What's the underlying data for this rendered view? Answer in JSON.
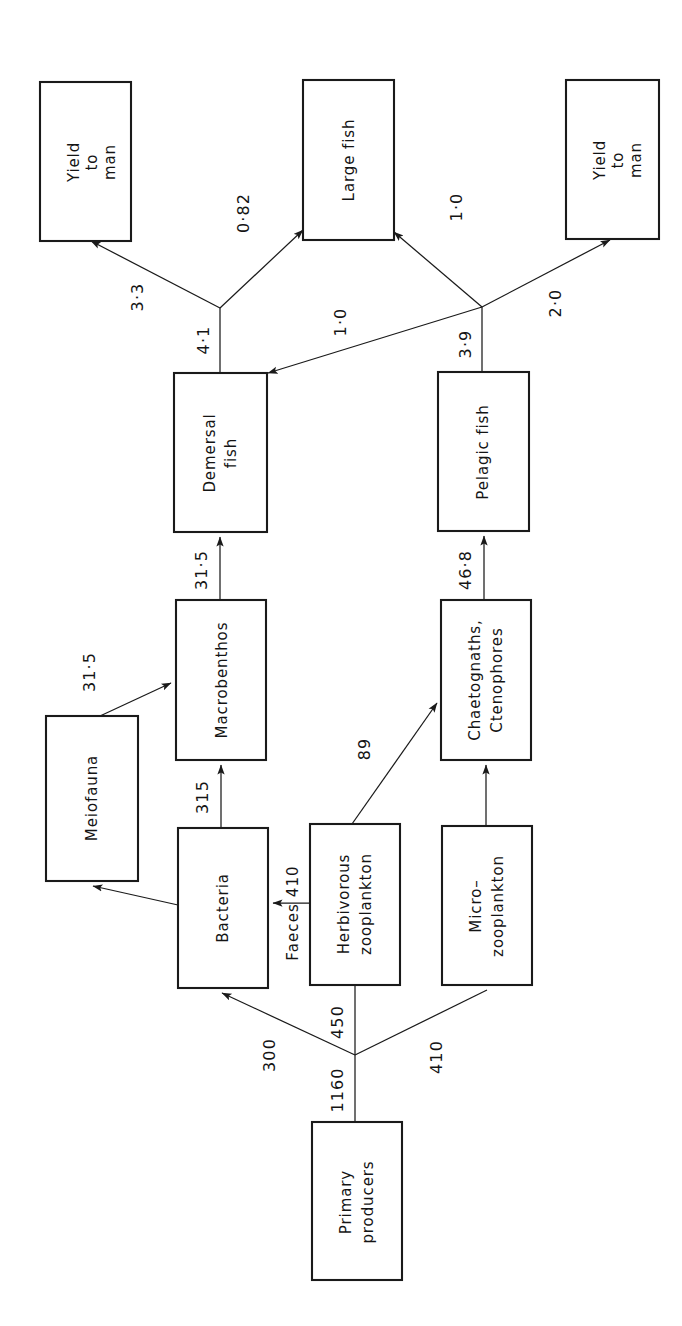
{
  "diagram": {
    "orientation": "rotated-90-ccw",
    "stroke_color": "#1a1a1a",
    "background_color": "#ffffff",
    "nodes": [
      {
        "id": "yield_left",
        "label_lines": [
          "Yield",
          "to",
          "man"
        ]
      },
      {
        "id": "large_fish",
        "label_lines": [
          "Large fish"
        ]
      },
      {
        "id": "yield_right",
        "label_lines": [
          "Yield",
          "to",
          "man"
        ]
      },
      {
        "id": "demersal_fish",
        "label_lines": [
          "Demersal",
          "fish"
        ]
      },
      {
        "id": "pelagic_fish",
        "label_lines": [
          "Pelagic fish"
        ]
      },
      {
        "id": "meiofauna",
        "label_lines": [
          "Meiofauna"
        ]
      },
      {
        "id": "macrobenthos",
        "label_lines": [
          "Macrobenthos"
        ]
      },
      {
        "id": "chaetognaths",
        "label_lines": [
          "Chaetognaths,",
          "Ctenophores"
        ]
      },
      {
        "id": "bacteria",
        "label_lines": [
          "Bacteria"
        ]
      },
      {
        "id": "herbivorous_zoo",
        "label_lines": [
          "Herbivorous",
          "zooplankton"
        ]
      },
      {
        "id": "micro_zoo",
        "label_lines": [
          "Micro–",
          "zooplankton"
        ]
      },
      {
        "id": "primary_producers",
        "label_lines": [
          "Primary",
          "producers"
        ]
      }
    ],
    "flows": [
      {
        "id": "f_yield_left",
        "value": "3·3",
        "from": "demersal_fish",
        "to": "yield_left"
      },
      {
        "id": "f_large_dem",
        "value": "0·82",
        "from": "demersal_fish",
        "to": "large_fish"
      },
      {
        "id": "f_dem_split",
        "value": "4·1",
        "from": "demersal_fish",
        "to": "split"
      },
      {
        "id": "f_large_pel",
        "value": "1·0",
        "from": "pelagic_fish",
        "to": "large_fish"
      },
      {
        "id": "f_pel_dem",
        "value": "1·0",
        "from": "pelagic_fish",
        "to": "demersal_fish"
      },
      {
        "id": "f_yield_right",
        "value": "2·0",
        "from": "pelagic_fish",
        "to": "yield_right"
      },
      {
        "id": "f_pel_split",
        "value": "3·9",
        "from": "pelagic_fish",
        "to": "split"
      },
      {
        "id": "f_macro_dem",
        "value": "31·5",
        "from": "macrobenthos",
        "to": "demersal_fish"
      },
      {
        "id": "f_chaeto_pel",
        "value": "46·8",
        "from": "chaetognaths",
        "to": "pelagic_fish"
      },
      {
        "id": "f_meio_macro",
        "value": "31·5",
        "from": "meiofauna",
        "to": "macrobenthos"
      },
      {
        "id": "f_bact_macro",
        "value": "315",
        "from": "bacteria",
        "to": "macrobenthos"
      },
      {
        "id": "f_bact_meio",
        "value": "",
        "from": "bacteria",
        "to": "meiofauna"
      },
      {
        "id": "f_faeces",
        "value": "Faeces 410",
        "from": "herbivorous_zoo",
        "to": "bacteria"
      },
      {
        "id": "f_herb_chaeto",
        "value": "89",
        "from": "herbivorous_zoo",
        "to": "chaetognaths"
      },
      {
        "id": "f_micro_chaeto",
        "value": "",
        "from": "micro_zoo",
        "to": "chaetognaths"
      },
      {
        "id": "f_pp_bact",
        "value": "300",
        "from": "primary_producers",
        "to": "bacteria"
      },
      {
        "id": "f_pp_herb",
        "value": "450",
        "from": "primary_producers",
        "to": "herbivorous_zoo"
      },
      {
        "id": "f_pp_micro",
        "value": "410",
        "from": "primary_producers",
        "to": "micro_zoo"
      },
      {
        "id": "f_pp_total",
        "value": "1160",
        "from": "primary_producers",
        "to": "split"
      }
    ]
  }
}
